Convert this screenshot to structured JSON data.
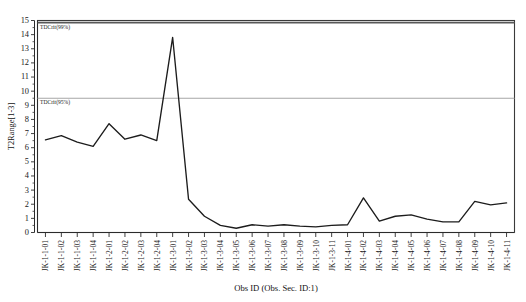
{
  "chart_data": {
    "type": "line",
    "title": "",
    "xlabel": "Obs ID (Obs. Sec. ID:1)",
    "ylabel": "T2Range[1-3]",
    "ylim": [
      0,
      15
    ],
    "ytick_step": 1,
    "grid": false,
    "legend": "none",
    "categories": [
      "JK-1-1-01",
      "JK-1-1-02",
      "JK-1-1-03",
      "JK-1-1-04",
      "JK-1-2-01",
      "JK-1-2-02",
      "JK-1-2-03",
      "JK-1-2-04",
      "JK-1-3-01",
      "JK-1-3-02",
      "JK-1-3-03",
      "JK-1-3-04",
      "JK-1-3-05",
      "JK-1-3-06",
      "JK-1-3-07",
      "JK-1-3-08",
      "JK-1-3-09",
      "JK-1-3-10",
      "JK-1-3-11",
      "JK-1-4-01",
      "JK-1-4-02",
      "JK-1-4-03",
      "JK-1-4-04",
      "JK-1-4-05",
      "JK-1-4-06",
      "JK-1-4-07",
      "JK-1-4-08",
      "JK-1-4-09",
      "JK-1-4-10",
      "JK-1-4-11"
    ],
    "values": [
      6.55,
      6.85,
      6.4,
      6.1,
      7.7,
      6.6,
      6.9,
      6.5,
      13.8,
      2.35,
      1.15,
      0.5,
      0.3,
      0.55,
      0.45,
      0.55,
      0.45,
      0.4,
      0.5,
      0.55,
      2.45,
      0.8,
      1.15,
      1.25,
      0.95,
      0.75,
      0.75,
      2.2,
      1.95,
      2.1
    ],
    "yticks": [
      "0",
      "1",
      "2",
      "3",
      "4",
      "5",
      "6",
      "7",
      "8",
      "9",
      "10",
      "11",
      "12",
      "13",
      "14",
      "15"
    ],
    "annotations": [
      {
        "name": "tdcrit-99",
        "label": "TDCrit(99%)",
        "value": 14.85,
        "color": "#585858"
      },
      {
        "name": "tdcrit-95",
        "label": "TDCrit(95%)",
        "value": 9.5,
        "color": "#a6a6a6"
      }
    ]
  }
}
